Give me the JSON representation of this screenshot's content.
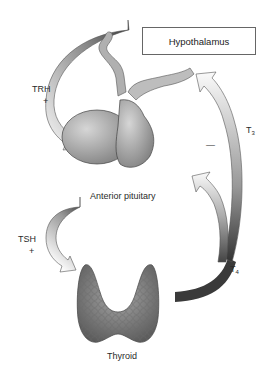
{
  "nodes": {
    "hypothalamus": "Hypothalamus",
    "anterior_pituitary": "Anterior pituitary",
    "thyroid": "Thyroid"
  },
  "hormones": {
    "trh": {
      "label": "TRH",
      "sign": "+"
    },
    "tsh": {
      "label": "TSH",
      "sign": "+"
    },
    "t3": {
      "label": "T",
      "subscript": "3"
    },
    "t4": {
      "label": "T",
      "subscript": "4"
    },
    "feedback_sign": "—"
  },
  "colors": {
    "arrow_dark": "#3a3a3a",
    "arrow_light": "#f2f2f2",
    "gland_fill": "#9a9a9a",
    "box_border": "#666666"
  }
}
